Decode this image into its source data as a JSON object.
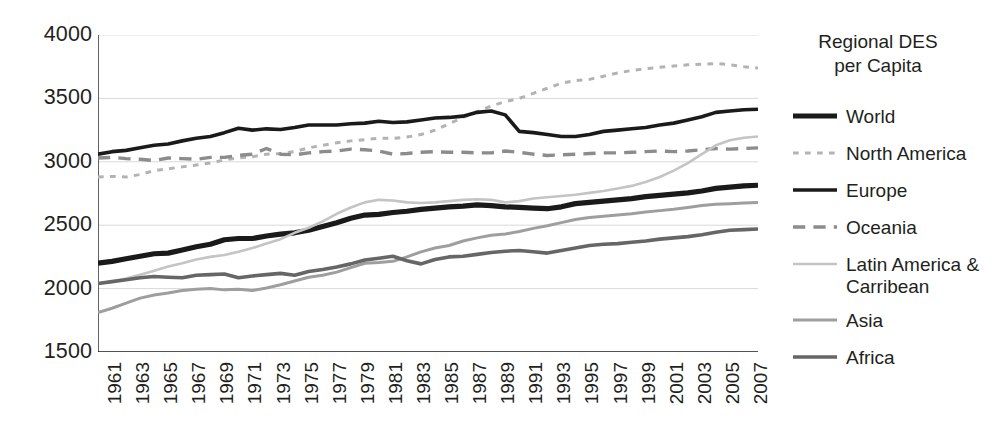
{
  "chart_data": {
    "type": "line",
    "title_line1": "Regional DES",
    "title_line2": "per Capita",
    "xlabel": "",
    "ylabel": "",
    "xlim": [
      1961,
      2008
    ],
    "ylim": [
      1500,
      4000
    ],
    "y_ticks": [
      4000,
      3500,
      3000,
      2500,
      2000,
      1500
    ],
    "grid": true,
    "legend_position": "right",
    "x": [
      1961,
      1962,
      1963,
      1964,
      1965,
      1966,
      1967,
      1968,
      1969,
      1970,
      1971,
      1972,
      1973,
      1974,
      1975,
      1976,
      1977,
      1978,
      1979,
      1980,
      1981,
      1982,
      1983,
      1984,
      1985,
      1986,
      1987,
      1988,
      1989,
      1990,
      1991,
      1992,
      1993,
      1994,
      1995,
      1996,
      1997,
      1998,
      1999,
      2000,
      2001,
      2002,
      2003,
      2004,
      2005,
      2006,
      2007,
      2008
    ],
    "x_tick_labels": [
      "1961",
      "1963",
      "1965",
      "1967",
      "1969",
      "1971",
      "1973",
      "1975",
      "1977",
      "1979",
      "1981",
      "1983",
      "1985",
      "1987",
      "1989",
      "1991",
      "1993",
      "1995",
      "1997",
      "1999",
      "2001",
      "2003",
      "2005",
      "2007"
    ],
    "series": [
      {
        "name": "World",
        "style": "solid",
        "width": 5.2,
        "color": "#1a1a1a",
        "values": [
          2200,
          2215,
          2235,
          2255,
          2275,
          2280,
          2305,
          2330,
          2350,
          2385,
          2395,
          2395,
          2415,
          2430,
          2440,
          2460,
          2490,
          2520,
          2555,
          2580,
          2585,
          2600,
          2610,
          2625,
          2635,
          2645,
          2650,
          2660,
          2655,
          2645,
          2640,
          2635,
          2630,
          2645,
          2670,
          2680,
          2690,
          2700,
          2710,
          2725,
          2735,
          2745,
          2755,
          2770,
          2790,
          2800,
          2810,
          2815
        ]
      },
      {
        "name": "North America",
        "style": "dotted",
        "width": 3.0,
        "color": "#b3b3b3",
        "values": [
          2880,
          2885,
          2880,
          2900,
          2930,
          2945,
          2960,
          2975,
          2990,
          3015,
          3030,
          3040,
          3060,
          3065,
          3080,
          3110,
          3130,
          3150,
          3165,
          3175,
          3185,
          3185,
          3195,
          3215,
          3250,
          3300,
          3350,
          3395,
          3440,
          3475,
          3500,
          3540,
          3580,
          3620,
          3640,
          3650,
          3675,
          3700,
          3720,
          3735,
          3745,
          3755,
          3765,
          3770,
          3775,
          3765,
          3750,
          3740
        ]
      },
      {
        "name": "Europe",
        "style": "solid",
        "width": 3.6,
        "color": "#1a1a1a",
        "values": [
          3060,
          3080,
          3090,
          3110,
          3130,
          3140,
          3165,
          3185,
          3200,
          3230,
          3265,
          3250,
          3260,
          3255,
          3270,
          3290,
          3290,
          3290,
          3300,
          3305,
          3320,
          3310,
          3315,
          3330,
          3345,
          3350,
          3360,
          3390,
          3400,
          3370,
          3240,
          3230,
          3215,
          3200,
          3200,
          3215,
          3240,
          3250,
          3260,
          3270,
          3290,
          3305,
          3330,
          3355,
          3390,
          3400,
          3410,
          3415
        ]
      },
      {
        "name": "Oceania",
        "style": "dashed",
        "width": 3.4,
        "color": "#8c8c8c",
        "values": [
          3030,
          3035,
          3025,
          3020,
          3010,
          3030,
          3025,
          3020,
          3035,
          3035,
          3050,
          3060,
          3105,
          3060,
          3055,
          3070,
          3080,
          3085,
          3100,
          3095,
          3085,
          3060,
          3065,
          3075,
          3080,
          3075,
          3075,
          3070,
          3070,
          3085,
          3075,
          3060,
          3050,
          3055,
          3060,
          3065,
          3070,
          3070,
          3075,
          3080,
          3085,
          3080,
          3085,
          3095,
          3105,
          3100,
          3105,
          3110
        ]
      },
      {
        "name": "Latin America & Carribean",
        "style": "solid",
        "width": 2.6,
        "color": "#c4c4c4",
        "values": [
          2040,
          2055,
          2080,
          2110,
          2140,
          2175,
          2200,
          2230,
          2250,
          2265,
          2290,
          2320,
          2355,
          2390,
          2440,
          2480,
          2530,
          2590,
          2640,
          2680,
          2700,
          2695,
          2680,
          2675,
          2680,
          2690,
          2700,
          2705,
          2700,
          2680,
          2690,
          2710,
          2720,
          2730,
          2740,
          2755,
          2770,
          2790,
          2810,
          2840,
          2880,
          2930,
          2990,
          3060,
          3130,
          3170,
          3190,
          3200
        ]
      },
      {
        "name": "Asia",
        "style": "solid",
        "width": 3.0,
        "color": "#9e9e9e",
        "values": [
          1810,
          1845,
          1885,
          1925,
          1950,
          1965,
          1985,
          1995,
          2000,
          1990,
          1995,
          1985,
          2005,
          2030,
          2060,
          2090,
          2105,
          2130,
          2165,
          2200,
          2205,
          2215,
          2250,
          2290,
          2320,
          2340,
          2375,
          2400,
          2420,
          2430,
          2450,
          2475,
          2495,
          2520,
          2545,
          2560,
          2570,
          2580,
          2590,
          2605,
          2615,
          2625,
          2640,
          2655,
          2665,
          2670,
          2675,
          2680
        ]
      },
      {
        "name": "Africa",
        "style": "solid",
        "width": 3.6,
        "color": "#666666",
        "values": [
          2040,
          2055,
          2070,
          2085,
          2095,
          2090,
          2085,
          2105,
          2110,
          2115,
          2085,
          2100,
          2110,
          2120,
          2105,
          2135,
          2150,
          2170,
          2195,
          2225,
          2240,
          2255,
          2220,
          2195,
          2230,
          2250,
          2255,
          2270,
          2285,
          2295,
          2300,
          2290,
          2280,
          2300,
          2320,
          2340,
          2350,
          2355,
          2365,
          2375,
          2390,
          2400,
          2410,
          2425,
          2445,
          2460,
          2465,
          2470
        ]
      }
    ]
  },
  "legend": {
    "title_line1": "Regional DES",
    "title_line2": "per Capita",
    "items": [
      {
        "label": "World",
        "label_line2": ""
      },
      {
        "label": "North America",
        "label_line2": ""
      },
      {
        "label": "Europe",
        "label_line2": ""
      },
      {
        "label": "Oceania",
        "label_line2": ""
      },
      {
        "label": "Latin America &",
        "label_line2": "Carribean"
      },
      {
        "label": "Asia",
        "label_line2": ""
      },
      {
        "label": "Africa",
        "label_line2": ""
      }
    ]
  },
  "axes": {
    "y_labels": [
      "4000",
      "3500",
      "3000",
      "2500",
      "2000",
      "1500"
    ],
    "x_labels": [
      "1961",
      "1963",
      "1965",
      "1967",
      "1969",
      "1971",
      "1973",
      "1975",
      "1977",
      "1979",
      "1981",
      "1983",
      "1985",
      "1987",
      "1989",
      "1991",
      "1993",
      "1995",
      "1997",
      "1999",
      "2001",
      "2003",
      "2005",
      "2007"
    ]
  },
  "colors": {
    "axis": "#231f20",
    "grid": "#d9d9d9",
    "background": "#ffffff"
  }
}
